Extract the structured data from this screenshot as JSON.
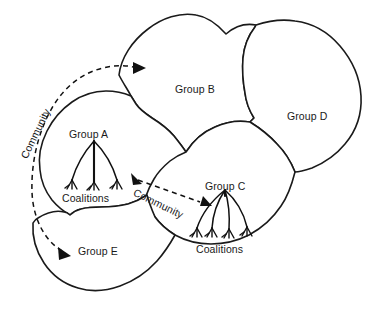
{
  "figure": {
    "kind": "conceptual-diagram",
    "title_text": "",
    "background_color": "#ffffff",
    "line_color": "#1a1a1a"
  },
  "groups": [
    {
      "id": "group-b",
      "label": "Group B",
      "label_x": 175,
      "label_y": 83,
      "has_tree": false
    },
    {
      "id": "group-d",
      "label": "Group D",
      "label_x": 287,
      "label_y": 110,
      "has_tree": false
    },
    {
      "id": "group-a",
      "label": "Group A",
      "label_x": 69,
      "label_y": 128,
      "has_tree": true,
      "coalitions_label": "Coalitions",
      "coalitions_label_x": 62,
      "coalitions_label_y": 192,
      "branch_count": 3
    },
    {
      "id": "group-c",
      "label": "Group C",
      "label_x": 205,
      "label_y": 180,
      "has_tree": true,
      "coalitions_label": "Coalitions",
      "coalitions_label_x": 196,
      "coalitions_label_y": 243,
      "branch_count": 4
    },
    {
      "id": "group-e",
      "label": "Group E",
      "label_x": 78,
      "label_y": 245,
      "has_tree": false
    }
  ],
  "connectors": [
    {
      "id": "community-left",
      "label": "Community",
      "style": "dashed",
      "arrowheads": "both",
      "shape": "curved-arc",
      "from_group": "group-e",
      "to_group": "group-b"
    },
    {
      "id": "community-right",
      "label": "Community",
      "style": "dashed",
      "arrowheads": "both",
      "shape": "straight",
      "from_group": "group-a",
      "to_group": "group-c"
    }
  ],
  "legend_terms": {
    "group": "Group",
    "coalitions": "Coalitions",
    "community": "Community"
  }
}
